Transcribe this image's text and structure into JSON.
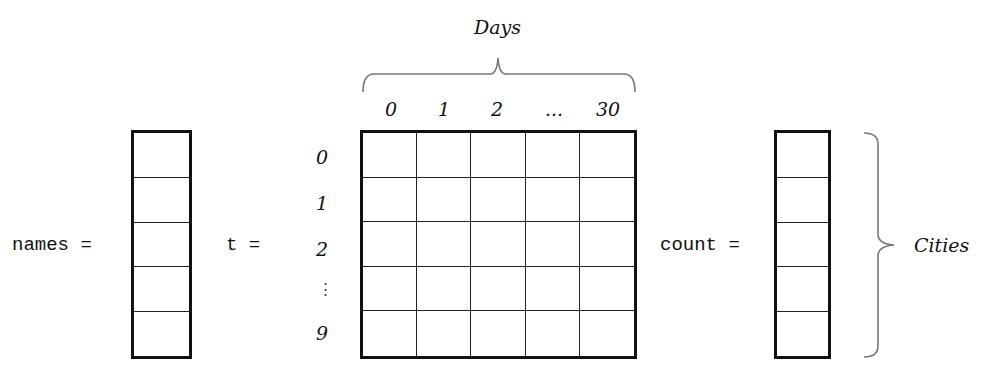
{
  "labels": {
    "names": "names =",
    "t": "t =",
    "count": "count ="
  },
  "axes": {
    "columns_title": "Days",
    "rows_title": "Cities",
    "column_ticks": [
      "0",
      "1",
      "2",
      "...",
      "30"
    ],
    "row_ticks": [
      "0",
      "1",
      "2",
      "⋮",
      "9"
    ]
  },
  "arrays": {
    "names_cells": 5,
    "count_cells": 5,
    "matrix_rows": 5,
    "matrix_cols": 5
  }
}
